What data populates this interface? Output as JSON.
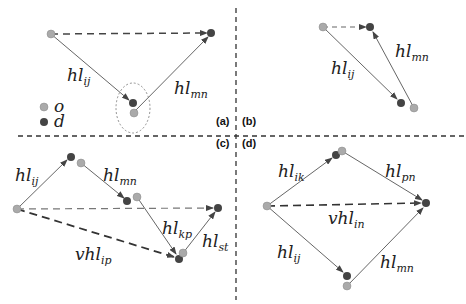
{
  "colors": {
    "origin": "#aaaaaa",
    "destination": "#444444",
    "line": "#555555",
    "divider": "#333333"
  },
  "legend": {
    "origin_label": "o",
    "destination_label": "d"
  },
  "panels": {
    "a": "(a)",
    "b": "(b)",
    "c": "(c)",
    "d": "(d)"
  },
  "labels": {
    "a": {
      "hl1": {
        "base": "hl",
        "sub": "ij"
      },
      "hl2": {
        "base": "hl",
        "sub": "mn"
      }
    },
    "b": {
      "hl1": {
        "base": "hl",
        "sub": "ij"
      },
      "hl2": {
        "base": "hl",
        "sub": "mn"
      }
    },
    "c": {
      "hl1": {
        "base": "hl",
        "sub": "ij"
      },
      "hl2": {
        "base": "hl",
        "sub": "mn"
      },
      "hl3": {
        "base": "hl",
        "sub": "kp"
      },
      "hl4": {
        "base": "hl",
        "sub": "st"
      },
      "vhl": {
        "base": "vhl",
        "sub": "ip"
      }
    },
    "d": {
      "hl1": {
        "base": "hl",
        "sub": "ik"
      },
      "hl2": {
        "base": "hl",
        "sub": "pn"
      },
      "vhl": {
        "base": "vhl",
        "sub": "in"
      },
      "hl3": {
        "base": "hl",
        "sub": "ij"
      },
      "hl4": {
        "base": "hl",
        "sub": "mn"
      }
    }
  }
}
